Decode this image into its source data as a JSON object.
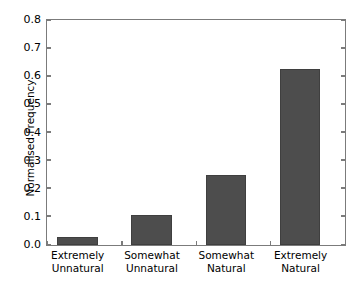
{
  "chart_data": {
    "type": "bar",
    "title": "",
    "xlabel": "",
    "ylabel": "Normalised Frequency",
    "categories": [
      "Extremely Unnatural",
      "Somewhat Unnatural",
      "Somewhat Natural",
      "Extremely Natural"
    ],
    "category_lines": [
      [
        "Extremely",
        "Unnatural"
      ],
      [
        "Somewhat",
        "Unnatural"
      ],
      [
        "Somewhat",
        "Natural"
      ],
      [
        "Extremely",
        "Natural"
      ]
    ],
    "values": [
      0.027,
      0.107,
      0.25,
      0.628
    ],
    "ylim": [
      0.0,
      0.8
    ],
    "yticks": [
      "0.0",
      "0.1",
      "0.2",
      "0.3",
      "0.4",
      "0.5",
      "0.6",
      "0.7",
      "0.8"
    ],
    "ytick_values": [
      0.0,
      0.1,
      0.2,
      0.3,
      0.4,
      0.5,
      0.6,
      0.7,
      0.8
    ],
    "grid": false,
    "legend": null,
    "bar_color": "#4d4d4d",
    "bar_edge_color": "#3f3f3f",
    "axis_color": "#7b7b7b",
    "background_color": "#ffffff"
  }
}
